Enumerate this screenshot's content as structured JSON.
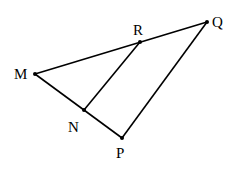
{
  "diagram": {
    "type": "geometry-figure",
    "points": [
      {
        "id": "M",
        "label": "M"
      },
      {
        "id": "R",
        "label": "R"
      },
      {
        "id": "Q",
        "label": "Q"
      },
      {
        "id": "N",
        "label": "N"
      },
      {
        "id": "P",
        "label": "P"
      }
    ],
    "segments": [
      {
        "from": "M",
        "to": "Q",
        "through": "R"
      },
      {
        "from": "M",
        "to": "P",
        "through": "N"
      },
      {
        "from": "P",
        "to": "Q"
      },
      {
        "from": "N",
        "to": "R"
      }
    ]
  }
}
